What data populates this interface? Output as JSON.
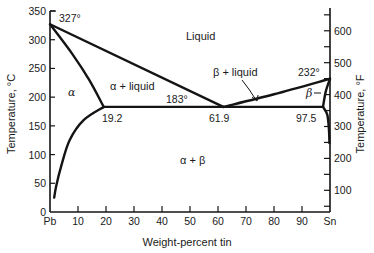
{
  "chart_data": {
    "type": "phase-diagram",
    "title": "",
    "xlabel": "Weight-percent tin",
    "ylabel_left": "Temperature, °C",
    "ylabel_right": "Temperature, °F",
    "xlim": [
      0,
      100
    ],
    "ylim_left": [
      0,
      350
    ],
    "x_ticks": [
      {
        "value": 0,
        "label": "Pb"
      },
      {
        "value": 10,
        "label": "10"
      },
      {
        "value": 20,
        "label": "20"
      },
      {
        "value": 30,
        "label": "30"
      },
      {
        "value": 40,
        "label": "40"
      },
      {
        "value": 50,
        "label": "50"
      },
      {
        "value": 60,
        "label": "60"
      },
      {
        "value": 70,
        "label": "70"
      },
      {
        "value": 80,
        "label": "80"
      },
      {
        "value": 90,
        "label": "90"
      },
      {
        "value": 100,
        "label": "Sn"
      }
    ],
    "y_ticks_left": [
      0,
      50,
      100,
      150,
      200,
      250,
      300,
      350
    ],
    "y_ticks_right_major": [
      100,
      200,
      300,
      400,
      500,
      600
    ],
    "y_ticks_right_minor": [
      50,
      150,
      250,
      350,
      450,
      550,
      650
    ],
    "special_points": {
      "pb_melting": {
        "wt_sn": 0,
        "temp_c": 327,
        "label": "327°"
      },
      "sn_melting": {
        "wt_sn": 100,
        "temp_c": 232,
        "label": "232°"
      },
      "eutectic": {
        "wt_sn": 61.9,
        "temp_c": 183,
        "label": "183°",
        "composition_label": "61.9"
      },
      "alpha_max_solubility": {
        "wt_sn": 19.2,
        "temp_c": 183,
        "label": "19.2"
      },
      "beta_max_solubility": {
        "wt_sn": 97.5,
        "temp_c": 183,
        "label": "97.5"
      }
    },
    "curves": {
      "liquidus_left": [
        [
          0,
          327
        ],
        [
          61.9,
          183
        ]
      ],
      "liquidus_right": [
        [
          61.9,
          183
        ],
        [
          80,
          205
        ],
        [
          100,
          232
        ]
      ],
      "solidus_alpha": [
        [
          0,
          327
        ],
        [
          8,
          275
        ],
        [
          14,
          230
        ],
        [
          19.2,
          183
        ]
      ],
      "solvus_alpha": [
        [
          19.2,
          183
        ],
        [
          12,
          160
        ],
        [
          7,
          125
        ],
        [
          4,
          80
        ],
        [
          2.2,
          45
        ],
        [
          1.5,
          25
        ]
      ],
      "eutectic_isotherm": [
        [
          19.2,
          183
        ],
        [
          97.5,
          183
        ]
      ],
      "solidus_beta": [
        [
          100,
          232
        ],
        [
          98.5,
          210
        ],
        [
          97.5,
          183
        ]
      ],
      "solvus_beta": [
        [
          97.5,
          183
        ],
        [
          99,
          170
        ],
        [
          99.6,
          145
        ],
        [
          99.8,
          120
        ]
      ]
    },
    "regions": [
      {
        "name": "liquid",
        "label": "Liquid"
      },
      {
        "name": "alpha",
        "label": "α"
      },
      {
        "name": "alpha-liquid",
        "label": "α + liquid"
      },
      {
        "name": "beta-liquid",
        "label": "β + liquid"
      },
      {
        "name": "beta",
        "label": "β"
      },
      {
        "name": "alpha-beta",
        "label": "α + β"
      }
    ]
  },
  "style": {
    "line_color": "#141414",
    "text_color": "#1a1a1a",
    "background": "#ffffff"
  }
}
